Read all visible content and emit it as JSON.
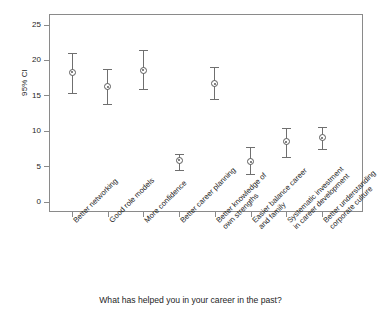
{
  "chart_data": {
    "type": "scatter",
    "title": "",
    "subtitle": "",
    "xlabel": "What has helped you in your career in the past?",
    "ylabel": "95% CI",
    "ylim": [
      0,
      26.5
    ],
    "yticks": [
      0,
      5,
      10,
      15,
      20,
      25
    ],
    "ytick_labels": [
      "0",
      "5",
      "10",
      "15",
      "20",
      "25"
    ],
    "grid": false,
    "legend": null,
    "marker": "circle-with-center-dot",
    "error_bars": "95% confidence interval",
    "categories": [
      "Better networking",
      "Good role models",
      "More confidence",
      "Better career planning",
      "Better knowledge of\nown strengths",
      "Easier balance career\nand family",
      "Systematic investment\nin career development",
      "Better understanding\ncorporate culture"
    ],
    "values": [
      18.3,
      16.3,
      18.6,
      5.9,
      16.7,
      5.7,
      8.5,
      9.1
    ],
    "ci_lower": [
      15.4,
      13.8,
      16.0,
      4.5,
      14.5,
      3.9,
      6.3,
      7.5
    ],
    "ci_upper": [
      21.0,
      18.8,
      21.4,
      6.8,
      19.0,
      7.8,
      10.5,
      10.6
    ],
    "colors": {
      "marker": "#5a5a5a",
      "error_bar": "#6f6f6f",
      "axis": "#8a8a8a",
      "text": "#1e1e1e",
      "background": "#ffffff"
    }
  }
}
